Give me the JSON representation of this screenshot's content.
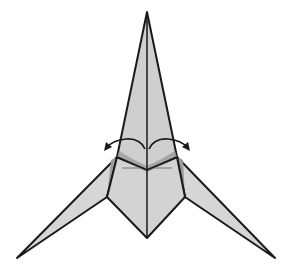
{
  "diagram": {
    "title": "Origami folding step",
    "colors": {
      "background": "#ffffff",
      "paper": "#d3d3d3",
      "paper_shadow": "#9a9a9a",
      "outline": "#1a1a1a",
      "crease": "#777777"
    },
    "arrows": [
      {
        "name": "swing-left-arrow",
        "direction": "left",
        "meaning": "swing flap outward"
      },
      {
        "name": "swing-right-arrow",
        "direction": "right",
        "meaning": "swing flap outward"
      }
    ]
  }
}
